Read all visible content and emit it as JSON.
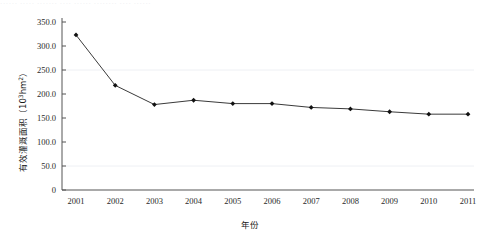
{
  "caption_strip": {
    "text": "······  ·····  ·······  ····  ······  ········  ····  ······"
  },
  "chart_data": {
    "type": "line",
    "title": "",
    "xlabel": "年份",
    "ylabel_main": "有效灌溉面积",
    "ylabel_unit_open": "（",
    "ylabel_unit_base": "10",
    "ylabel_unit_exp": "3",
    "ylabel_unit_tail": "hm",
    "ylabel_unit_tail_exp": "2",
    "ylabel_unit_close": "）",
    "ylabel": "有效灌溉面积（10³hm²）",
    "categories": [
      "2001",
      "2002",
      "2003",
      "2004",
      "2005",
      "2006",
      "2007",
      "2008",
      "2009",
      "2010",
      "2011"
    ],
    "values": [
      323.0,
      218.0,
      178.0,
      187.0,
      180.0,
      180.0,
      172.0,
      169.0,
      163.0,
      158.0,
      158.0
    ],
    "ytick_labels": [
      "0",
      "50.0",
      "100.0",
      "150.0",
      "200.0",
      "250.0",
      "300.0",
      "350.0"
    ],
    "ytick_values": [
      0,
      50,
      100,
      150,
      200,
      250,
      300,
      350
    ],
    "ylim": [
      0,
      350
    ],
    "grid": true,
    "legend": "none",
    "marker": "filled-diamond",
    "series_color": "#3a3a3a",
    "grid_color": "#eef0f4"
  }
}
